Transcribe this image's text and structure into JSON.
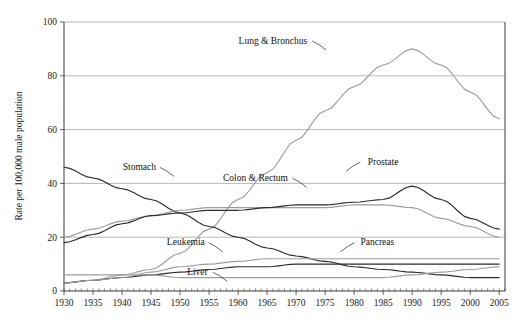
{
  "chart_data": {
    "type": "line",
    "title": "",
    "xlabel": "",
    "ylabel": "Rate per 100,000 male population",
    "xlim": [
      1930,
      2006
    ],
    "ylim": [
      0,
      100
    ],
    "grid": true,
    "legend_position": "inline-labels",
    "y_ticks": [
      "0",
      "20",
      "40",
      "60",
      "80",
      "100"
    ],
    "x_ticks": [
      "1930",
      "1935",
      "1940",
      "1945",
      "1950",
      "1955",
      "1960",
      "1965",
      "1970",
      "1975",
      "1980",
      "1985",
      "1990",
      "1995",
      "2000",
      "2005"
    ],
    "x": [
      1930,
      1935,
      1940,
      1945,
      1950,
      1955,
      1960,
      1965,
      1970,
      1975,
      1980,
      1985,
      1990,
      1995,
      2000,
      2005
    ],
    "series": [
      {
        "name": "Lung & Bronchus",
        "color": "#9d9d9d",
        "style": "gray",
        "label_x": 1966,
        "label_y": 92,
        "values": [
          3,
          4,
          6,
          8,
          14,
          23,
          34,
          44,
          56,
          67,
          76,
          84,
          90,
          84,
          74,
          64
        ]
      },
      {
        "name": "Stomach",
        "color": "#2b2b2b",
        "style": "dark",
        "label_x": 1943,
        "label_y": 45,
        "values": [
          46,
          42,
          38,
          34,
          29,
          24,
          20,
          16,
          13,
          11,
          9,
          8,
          7,
          6,
          5,
          5
        ]
      },
      {
        "name": "Colon & Rectum",
        "color": "#9d9d9d",
        "style": "gray",
        "label_x": 1963,
        "label_y": 41,
        "values": [
          20,
          23,
          26,
          28,
          30,
          31,
          31,
          31,
          31,
          31,
          32,
          32,
          31,
          27,
          24,
          20
        ]
      },
      {
        "name": "Prostate",
        "color": "#2b2b2b",
        "style": "dark",
        "label_x": 1985,
        "label_y": 47,
        "values": [
          18,
          21,
          25,
          28,
          29,
          30,
          30,
          31,
          32,
          32,
          33,
          34,
          39,
          34,
          27,
          23
        ]
      },
      {
        "name": "Leukemia",
        "color": "#2b2b2b",
        "style": "dark",
        "label_x": 1951,
        "label_y": 17,
        "values": [
          3,
          4,
          5,
          6,
          7,
          8,
          9,
          9,
          10,
          10,
          10,
          10,
          10,
          10,
          10,
          10
        ]
      },
      {
        "name": "Pancreas",
        "color": "#9d9d9d",
        "style": "gray",
        "label_x": 1984,
        "label_y": 17,
        "values": [
          3,
          4,
          5,
          7,
          9,
          10,
          11,
          12,
          12,
          12,
          12,
          12,
          12,
          12,
          12,
          12
        ]
      },
      {
        "name": "Liver",
        "color": "#9d9d9d",
        "style": "gray",
        "label_x": 1953,
        "label_y": 6,
        "values": [
          6,
          6,
          6,
          6,
          5,
          5,
          5,
          5,
          5,
          5,
          5,
          5,
          6,
          7,
          8,
          9
        ]
      }
    ]
  }
}
